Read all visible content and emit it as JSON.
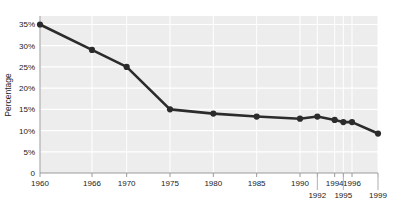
{
  "chart_data": {
    "type": "line",
    "title": "",
    "xlabel": "",
    "ylabel": "Percentage",
    "x": [
      1960,
      1966,
      1970,
      1975,
      1980,
      1985,
      1990,
      1992,
      1994,
      1995,
      1996,
      1999
    ],
    "values": [
      35,
      29,
      25,
      15,
      14,
      13.3,
      12.8,
      13.3,
      12.5,
      12,
      12,
      9.3
    ],
    "xtick_labels": [
      "1960",
      "1966",
      "1970",
      "1975",
      "1980",
      "1985",
      "1990",
      "1992",
      "1994",
      "1995",
      "1996",
      "1999"
    ],
    "xtick_rows": [
      0,
      0,
      0,
      0,
      0,
      0,
      0,
      1,
      0,
      1,
      0,
      1
    ],
    "ytick_labels": [
      "0",
      "5%",
      "10%",
      "15%",
      "20%",
      "25%",
      "30%",
      "35%"
    ],
    "ytick_values": [
      0,
      5,
      10,
      15,
      20,
      25,
      30,
      35
    ],
    "ylim": [
      0,
      37
    ],
    "xlim": [
      1960,
      1999
    ],
    "grid": true,
    "legend": "none",
    "series_color": "#2b2b2b",
    "plot_bg_color": "#ededed",
    "gridline_color": "#ffffff",
    "axis_color": "#9a9a9a",
    "marker": "circle"
  }
}
